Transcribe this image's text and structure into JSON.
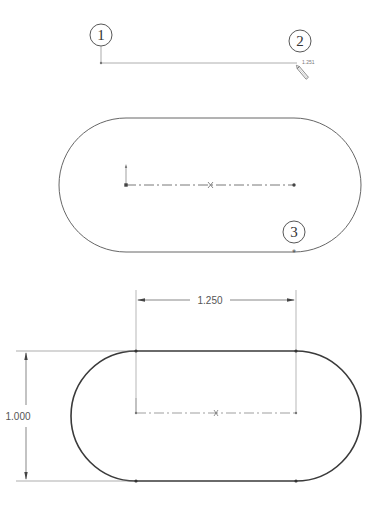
{
  "figure": {
    "colors": {
      "background": "#ffffff",
      "thin_line": "#888888",
      "outline": "#555555",
      "bold_outline": "#3a3a3a",
      "callout": "#444444"
    }
  },
  "step1": {
    "callouts": [
      {
        "label": "1",
        "cx": 101,
        "cy": 35
      },
      {
        "label": "2",
        "cx": 300,
        "cy": 41
      }
    ],
    "line_length_label": "1.251"
  },
  "step2": {
    "callouts": [
      {
        "label": "3",
        "cx": 294,
        "cy": 232
      }
    ]
  },
  "step3": {
    "dimensions": {
      "horizontal": "1.250",
      "vertical": "1.000"
    }
  }
}
